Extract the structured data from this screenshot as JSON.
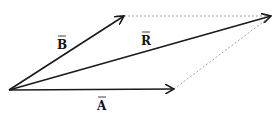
{
  "diagram": {
    "colors": {
      "vector": "#1a1a1a",
      "dashed": "#888888",
      "background": "#ffffff"
    },
    "origin": {
      "x": 9,
      "y": 90
    },
    "vectors": [
      {
        "id": "A",
        "label": "A",
        "accent": "→",
        "tip": {
          "x": 174,
          "y": 89
        }
      },
      {
        "id": "B",
        "label": "B",
        "accent": "→",
        "tip": {
          "x": 124,
          "y": 16
        }
      },
      {
        "id": "R",
        "label": "R",
        "accent": "→",
        "tip": {
          "x": 271,
          "y": 16
        }
      }
    ],
    "dashed_lines": [
      {
        "from": "B-tip",
        "to": "R-tip"
      },
      {
        "from": "A-tip",
        "to": "R-tip"
      }
    ],
    "labels": {
      "A": "A",
      "B": "B",
      "R": "R"
    }
  }
}
